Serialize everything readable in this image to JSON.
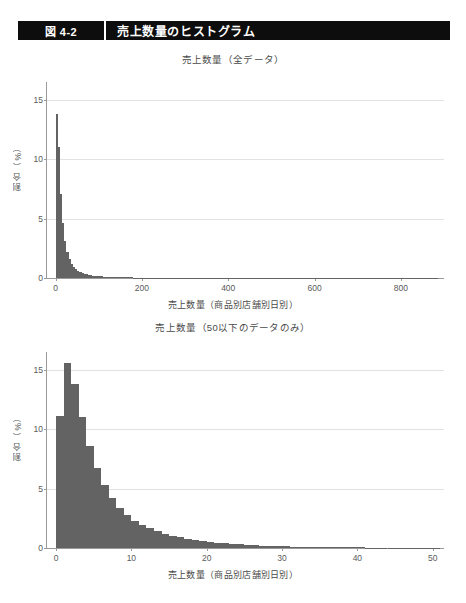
{
  "header": {
    "figure_number": "図 4-2",
    "figure_title": "売上数量のヒストグラム"
  },
  "colors": {
    "header_bg": "#0d0d0d",
    "header_text": "#ffffff",
    "bar": "#636363",
    "grid": "#e2e2e2",
    "axis": "#9a9a9a",
    "page_bg": "#ffffff"
  },
  "chart_data": [
    {
      "id": "chart-all-data",
      "type": "bar",
      "title": "売上数量（全データ）",
      "xlabel": "売上数量（商品別店舗別日別）",
      "ylabel": "割合（%）",
      "xlim": [
        -20,
        900
      ],
      "ylim": [
        0,
        16.5
      ],
      "grid": true,
      "legend": "none",
      "xticks": [
        0,
        200,
        400,
        600,
        800
      ],
      "xtick_labels": [
        "0",
        "200",
        "400",
        "600",
        "800"
      ],
      "yticks": [
        0,
        5,
        10,
        15
      ],
      "ytick_labels": [
        "0",
        "5",
        "10",
        "15"
      ],
      "bin_width": 5,
      "x": [
        0,
        5,
        10,
        15,
        20,
        25,
        30,
        35,
        40,
        45,
        50,
        55,
        60,
        65,
        70,
        75,
        80,
        85,
        90,
        95,
        100,
        110,
        120,
        130,
        140,
        150,
        160,
        180,
        200,
        220,
        240,
        260,
        300,
        350,
        400,
        450,
        500,
        600,
        700,
        800,
        880
      ],
      "values": [
        13.8,
        11.0,
        7.1,
        4.6,
        3.1,
        2.2,
        1.6,
        1.2,
        0.95,
        0.75,
        0.6,
        0.5,
        0.42,
        0.35,
        0.3,
        0.26,
        0.22,
        0.19,
        0.17,
        0.15,
        0.13,
        0.11,
        0.09,
        0.08,
        0.07,
        0.06,
        0.05,
        0.04,
        0.035,
        0.03,
        0.025,
        0.02,
        0.015,
        0.012,
        0.01,
        0.008,
        0.006,
        0.004,
        0.003,
        0.002,
        0.001
      ]
    },
    {
      "id": "chart-under-50",
      "type": "bar",
      "title": "売上数量（50以下のデータのみ）",
      "xlabel": "売上数量（商品別店舗別日別）",
      "ylabel": "割合（%）",
      "xlim": [
        -1.2,
        51.5
      ],
      "ylim": [
        0,
        16.5
      ],
      "grid": true,
      "legend": "none",
      "xticks": [
        0,
        10,
        20,
        30,
        40,
        50
      ],
      "xtick_labels": [
        "0",
        "10",
        "20",
        "30",
        "40",
        "50"
      ],
      "yticks": [
        0,
        5,
        10,
        15
      ],
      "ytick_labels": [
        "0",
        "5",
        "10",
        "15"
      ],
      "bin_width": 1,
      "x": [
        0,
        1,
        2,
        3,
        4,
        5,
        6,
        7,
        8,
        9,
        10,
        11,
        12,
        13,
        14,
        15,
        16,
        17,
        18,
        19,
        20,
        21,
        22,
        23,
        24,
        25,
        26,
        27,
        28,
        29,
        30,
        31,
        32,
        33,
        34,
        35,
        36,
        37,
        38,
        39,
        40,
        41,
        42,
        43,
        44,
        45,
        46,
        47,
        48,
        49,
        50
      ],
      "values": [
        11.1,
        15.6,
        13.8,
        11.0,
        8.6,
        6.7,
        5.3,
        4.2,
        3.4,
        2.8,
        2.3,
        1.95,
        1.65,
        1.42,
        1.22,
        1.05,
        0.9,
        0.78,
        0.68,
        0.59,
        0.51,
        0.45,
        0.39,
        0.34,
        0.3,
        0.26,
        0.23,
        0.2,
        0.18,
        0.16,
        0.14,
        0.12,
        0.11,
        0.1,
        0.09,
        0.08,
        0.07,
        0.06,
        0.055,
        0.05,
        0.045,
        0.04,
        0.035,
        0.03,
        0.028,
        0.025,
        0.022,
        0.02,
        0.018,
        0.016,
        0.014
      ]
    }
  ]
}
